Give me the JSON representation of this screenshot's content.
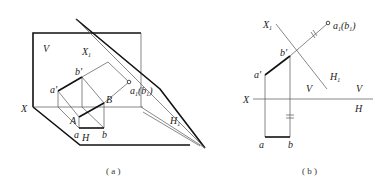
{
  "panels": [
    {
      "id": "a",
      "caption": "( a )",
      "labels": {
        "V": "V",
        "X1": "X",
        "X1_sub": "1",
        "b_prime": "b'",
        "a_prime": "a'",
        "a1b1": "a",
        "a1b1_sub": "1",
        "a1b1_rest": "(b",
        "a1b1_sub2": "1",
        "a1b1_end": ")",
        "X": "X",
        "B": "B",
        "A": "A",
        "H1": "H",
        "H1_sub": "1",
        "a": "a",
        "H": "H",
        "b": "b"
      }
    },
    {
      "id": "b",
      "caption": "( b )",
      "labels": {
        "X1": "X",
        "X1_sub": "1",
        "a1b1": "a",
        "a1b1_sub": "1",
        "a1b1_rest": "(b",
        "a1b1_sub2": "1",
        "a1b1_end": ")",
        "b_prime": "b'",
        "a_prime": "a'",
        "H1": "H",
        "H1_sub": "1",
        "V_left": "V",
        "V_right": "V",
        "X": "X",
        "H": "H",
        "a": "a",
        "b": "b"
      }
    }
  ]
}
